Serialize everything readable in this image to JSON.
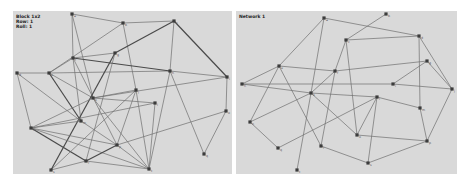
{
  "panels": [
    {
      "id": "left",
      "label_lines": [
        "Block 1x2",
        "Row: 1",
        "Roll: 1"
      ],
      "background": "#d9d9d9",
      "nodes": [
        {
          "id": "a",
          "x": 72,
          "y": 14,
          "label": "a"
        },
        {
          "id": "b",
          "x": 123,
          "y": 23,
          "label": "b"
        },
        {
          "id": "c",
          "x": 174,
          "y": 21,
          "label": "c"
        },
        {
          "id": "d",
          "x": 17,
          "y": 73,
          "label": "d"
        },
        {
          "id": "e",
          "x": 49,
          "y": 73,
          "label": "e"
        },
        {
          "id": "f",
          "x": 73,
          "y": 58,
          "label": "f"
        },
        {
          "id": "g",
          "x": 115,
          "y": 53,
          "label": "g"
        },
        {
          "id": "h",
          "x": 170,
          "y": 71,
          "label": "h"
        },
        {
          "id": "i",
          "x": 227,
          "y": 77,
          "label": "i"
        },
        {
          "id": "j",
          "x": 136,
          "y": 90,
          "label": "j"
        },
        {
          "id": "k",
          "x": 93,
          "y": 98,
          "label": "k"
        },
        {
          "id": "l",
          "x": 155,
          "y": 103,
          "label": "l"
        },
        {
          "id": "m",
          "x": 81,
          "y": 121,
          "label": "m"
        },
        {
          "id": "n",
          "x": 31,
          "y": 128,
          "label": "n"
        },
        {
          "id": "o",
          "x": 226,
          "y": 111,
          "label": "o"
        },
        {
          "id": "p",
          "x": 117,
          "y": 145,
          "label": "p"
        },
        {
          "id": "q",
          "x": 204,
          "y": 154,
          "label": "q"
        },
        {
          "id": "r",
          "x": 86,
          "y": 161,
          "label": "r"
        },
        {
          "id": "s",
          "x": 51,
          "y": 170,
          "label": "s"
        },
        {
          "id": "t",
          "x": 149,
          "y": 169,
          "label": "t"
        }
      ],
      "edges": [
        [
          "a",
          "b",
          0
        ],
        [
          "a",
          "f",
          0
        ],
        [
          "a",
          "k",
          0
        ],
        [
          "b",
          "c",
          0
        ],
        [
          "b",
          "e",
          0
        ],
        [
          "b",
          "j",
          0
        ],
        [
          "c",
          "i",
          1
        ],
        [
          "c",
          "g",
          1
        ],
        [
          "c",
          "h",
          0
        ],
        [
          "d",
          "e",
          0
        ],
        [
          "d",
          "n",
          0
        ],
        [
          "e",
          "f",
          0
        ],
        [
          "e",
          "h",
          0
        ],
        [
          "e",
          "m",
          1
        ],
        [
          "e",
          "k",
          0
        ],
        [
          "f",
          "h",
          1
        ],
        [
          "f",
          "m",
          0
        ],
        [
          "f",
          "p",
          0
        ],
        [
          "g",
          "s",
          1
        ],
        [
          "g",
          "r",
          0
        ],
        [
          "h",
          "i",
          0
        ],
        [
          "h",
          "q",
          0
        ],
        [
          "h",
          "t",
          0
        ],
        [
          "i",
          "o",
          0
        ],
        [
          "i",
          "k",
          0
        ],
        [
          "j",
          "k",
          0
        ],
        [
          "j",
          "p",
          0
        ],
        [
          "j",
          "t",
          0
        ],
        [
          "k",
          "n",
          0
        ],
        [
          "k",
          "l",
          0
        ],
        [
          "k",
          "t",
          0
        ],
        [
          "l",
          "n",
          0
        ],
        [
          "l",
          "t",
          0
        ],
        [
          "m",
          "n",
          0
        ],
        [
          "m",
          "p",
          0
        ],
        [
          "n",
          "r",
          1
        ],
        [
          "n",
          "p",
          0
        ],
        [
          "n",
          "t",
          0
        ],
        [
          "o",
          "q",
          0
        ],
        [
          "o",
          "p",
          0
        ],
        [
          "p",
          "r",
          1
        ],
        [
          "p",
          "t",
          0
        ],
        [
          "r",
          "s",
          0
        ],
        [
          "r",
          "t",
          0
        ],
        [
          "s",
          "j",
          0
        ],
        [
          "m",
          "d",
          0
        ],
        [
          "g",
          "f",
          0
        ]
      ]
    },
    {
      "id": "right",
      "label_lines": [
        "Network 1"
      ],
      "background": "#d9d9d9",
      "nodes": [
        {
          "id": "a",
          "x": 324,
          "y": 18,
          "label": "a"
        },
        {
          "id": "b",
          "x": 386,
          "y": 14,
          "label": "b"
        },
        {
          "id": "c",
          "x": 346,
          "y": 40,
          "label": "c"
        },
        {
          "id": "d",
          "x": 419,
          "y": 36,
          "label": "d"
        },
        {
          "id": "e",
          "x": 279,
          "y": 66,
          "label": "e"
        },
        {
          "id": "f",
          "x": 335,
          "y": 71,
          "label": "f"
        },
        {
          "id": "g",
          "x": 427,
          "y": 61,
          "label": "g"
        },
        {
          "id": "h",
          "x": 242,
          "y": 84,
          "label": "h"
        },
        {
          "id": "i",
          "x": 393,
          "y": 84,
          "label": "i"
        },
        {
          "id": "j",
          "x": 452,
          "y": 89,
          "label": "j"
        },
        {
          "id": "k",
          "x": 311,
          "y": 93,
          "label": "k"
        },
        {
          "id": "l",
          "x": 377,
          "y": 97,
          "label": "l"
        },
        {
          "id": "m",
          "x": 420,
          "y": 108,
          "label": "m"
        },
        {
          "id": "n",
          "x": 250,
          "y": 122,
          "label": "n"
        },
        {
          "id": "o",
          "x": 357,
          "y": 135,
          "label": "o"
        },
        {
          "id": "p",
          "x": 427,
          "y": 141,
          "label": "p"
        },
        {
          "id": "q",
          "x": 278,
          "y": 148,
          "label": "q"
        },
        {
          "id": "r",
          "x": 321,
          "y": 146,
          "label": "r"
        },
        {
          "id": "s",
          "x": 368,
          "y": 163,
          "label": "s"
        },
        {
          "id": "t",
          "x": 297,
          "y": 170,
          "label": "t"
        }
      ],
      "edges": [
        [
          "a",
          "e",
          0
        ],
        [
          "a",
          "d",
          0
        ],
        [
          "a",
          "k",
          0
        ],
        [
          "b",
          "c",
          0
        ],
        [
          "c",
          "d",
          0
        ],
        [
          "c",
          "f",
          0
        ],
        [
          "c",
          "o",
          0
        ],
        [
          "d",
          "j",
          0
        ],
        [
          "d",
          "m",
          0
        ],
        [
          "e",
          "h",
          0
        ],
        [
          "e",
          "f",
          0
        ],
        [
          "e",
          "n",
          0
        ],
        [
          "e",
          "r",
          0
        ],
        [
          "f",
          "g",
          0
        ],
        [
          "f",
          "k",
          0
        ],
        [
          "f",
          "r",
          0
        ],
        [
          "g",
          "i",
          0
        ],
        [
          "g",
          "j",
          0
        ],
        [
          "h",
          "k",
          0
        ],
        [
          "h",
          "i",
          0
        ],
        [
          "i",
          "j",
          0
        ],
        [
          "k",
          "l",
          0
        ],
        [
          "k",
          "o",
          0
        ],
        [
          "k",
          "n",
          0
        ],
        [
          "l",
          "m",
          0
        ],
        [
          "l",
          "o",
          0
        ],
        [
          "l",
          "s",
          0
        ],
        [
          "l",
          "q",
          0
        ],
        [
          "m",
          "p",
          0
        ],
        [
          "j",
          "p",
          0
        ],
        [
          "n",
          "q",
          0
        ],
        [
          "o",
          "p",
          0
        ],
        [
          "p",
          "s",
          0
        ],
        [
          "r",
          "s",
          0
        ],
        [
          "k",
          "t",
          0
        ]
      ]
    }
  ]
}
